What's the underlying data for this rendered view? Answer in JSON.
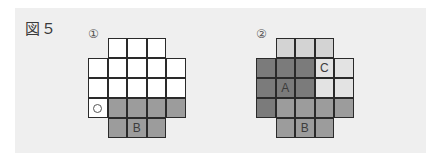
{
  "figure": {
    "title": "図５",
    "panels": [
      {
        "number": "①",
        "rows": [
          {
            "start_col": 1,
            "cells": [
              {
                "fill": "white",
                "label": ""
              },
              {
                "fill": "white",
                "label": ""
              },
              {
                "fill": "white",
                "label": ""
              }
            ]
          },
          {
            "start_col": 0,
            "cells": [
              {
                "fill": "white",
                "label": ""
              },
              {
                "fill": "white",
                "label": ""
              },
              {
                "fill": "white",
                "label": ""
              },
              {
                "fill": "white",
                "label": ""
              },
              {
                "fill": "white",
                "label": ""
              }
            ]
          },
          {
            "start_col": 0,
            "cells": [
              {
                "fill": "white",
                "label": ""
              },
              {
                "fill": "white",
                "label": ""
              },
              {
                "fill": "white",
                "label": ""
              },
              {
                "fill": "white",
                "label": ""
              },
              {
                "fill": "white",
                "label": ""
              }
            ]
          },
          {
            "start_col": 0,
            "cells": [
              {
                "fill": "white",
                "label": "",
                "mark": "circle"
              },
              {
                "fill": "mid",
                "label": ""
              },
              {
                "fill": "mid",
                "label": ""
              },
              {
                "fill": "mid",
                "label": ""
              },
              {
                "fill": "mid",
                "label": ""
              }
            ]
          },
          {
            "start_col": 1,
            "cells": [
              {
                "fill": "mid",
                "label": ""
              },
              {
                "fill": "mid",
                "label": "B"
              },
              {
                "fill": "mid",
                "label": ""
              }
            ]
          }
        ]
      },
      {
        "number": "②",
        "rows": [
          {
            "start_col": 1,
            "cells": [
              {
                "fill": "light",
                "label": ""
              },
              {
                "fill": "light",
                "label": ""
              },
              {
                "fill": "light",
                "label": ""
              }
            ]
          },
          {
            "start_col": 0,
            "cells": [
              {
                "fill": "dark",
                "label": ""
              },
              {
                "fill": "dark",
                "label": ""
              },
              {
                "fill": "dark",
                "label": ""
              },
              {
                "fill": "vlight",
                "label": "C"
              },
              {
                "fill": "vlight",
                "label": ""
              }
            ]
          },
          {
            "start_col": 0,
            "cells": [
              {
                "fill": "dark",
                "label": ""
              },
              {
                "fill": "dark",
                "label": "A"
              },
              {
                "fill": "dark",
                "label": ""
              },
              {
                "fill": "vlight",
                "label": ""
              },
              {
                "fill": "vlight",
                "label": ""
              }
            ]
          },
          {
            "start_col": 0,
            "cells": [
              {
                "fill": "dark",
                "label": ""
              },
              {
                "fill": "mid",
                "label": ""
              },
              {
                "fill": "mid",
                "label": ""
              },
              {
                "fill": "mid",
                "label": ""
              },
              {
                "fill": "mid",
                "label": ""
              }
            ]
          },
          {
            "start_col": 1,
            "cells": [
              {
                "fill": "mid",
                "label": ""
              },
              {
                "fill": "mid",
                "label": "B"
              },
              {
                "fill": "mid",
                "label": ""
              }
            ]
          }
        ]
      }
    ],
    "colors": {
      "panel_bg": "#efefef",
      "white": "#ffffff",
      "light": "#d3d3d3",
      "vlight": "#e3e3e3",
      "mid": "#9c9c9c",
      "dark": "#7b7b7b",
      "border": "#2a2a2a"
    }
  }
}
